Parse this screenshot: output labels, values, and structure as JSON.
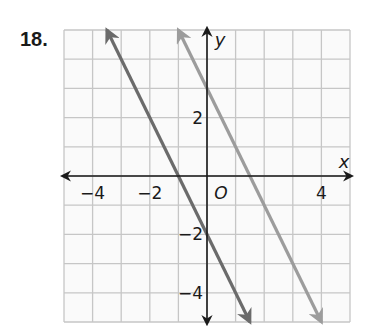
{
  "problem": {
    "number": "18."
  },
  "chart_data": {
    "type": "line",
    "title": "",
    "xlabel": "x",
    "ylabel": "y",
    "origin_label": "O",
    "xlim": [
      -5,
      5
    ],
    "ylim": [
      -5,
      5
    ],
    "grid": true,
    "grid_step": 1,
    "x_tick_labels": [
      {
        "value": -4,
        "label": "−4"
      },
      {
        "value": -2,
        "label": "−2"
      },
      {
        "value": 4,
        "label": "4"
      }
    ],
    "y_tick_labels": [
      {
        "value": 2,
        "label": "2"
      },
      {
        "value": -2,
        "label": "−2"
      },
      {
        "value": -4,
        "label": "−4"
      }
    ],
    "series": [
      {
        "name": "line-1",
        "equation": "y = -2x - 2",
        "slope": -2,
        "intercept": -2,
        "x": [
          -3.5,
          1.5
        ],
        "y": [
          5,
          -5
        ],
        "color": "#6b6b6b",
        "arrows": "both"
      },
      {
        "name": "line-2",
        "equation": "y = -2x + 3",
        "slope": -2,
        "intercept": 3,
        "x": [
          -1,
          4
        ],
        "y": [
          5,
          -5
        ],
        "color": "#9c9c9c",
        "arrows": "both"
      }
    ],
    "colors": {
      "grid": "#c6c6c6",
      "axis": "#1a1a1a",
      "background": "#fafafa"
    }
  }
}
